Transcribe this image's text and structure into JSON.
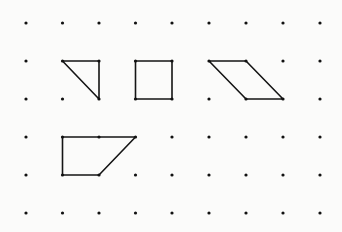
{
  "diagram": {
    "type": "dot-grid-shapes",
    "grid": {
      "columns": 9,
      "rows": 6,
      "x_positions": [
        26,
        62.5,
        99,
        135.5,
        172,
        209,
        246,
        283,
        320
      ],
      "y_positions": [
        23,
        61,
        99,
        137,
        175,
        213
      ],
      "dot_radius": 1.6,
      "dot_color": "#111111"
    },
    "stroke_color": "#151515",
    "stroke_width": 1.6,
    "shapes": [
      {
        "name": "right-triangle",
        "points": [
          [
            1,
            1
          ],
          [
            2,
            1
          ],
          [
            2,
            2
          ]
        ]
      },
      {
        "name": "square",
        "points": [
          [
            3,
            1
          ],
          [
            4,
            1
          ],
          [
            4,
            2
          ],
          [
            3,
            2
          ]
        ]
      },
      {
        "name": "parallelogram",
        "points": [
          [
            5,
            1
          ],
          [
            6,
            1
          ],
          [
            7,
            2
          ],
          [
            6,
            2
          ]
        ]
      },
      {
        "name": "trapezoid",
        "points": [
          [
            1,
            3
          ],
          [
            3,
            3
          ],
          [
            2,
            4
          ],
          [
            1,
            4
          ]
        ]
      }
    ]
  }
}
